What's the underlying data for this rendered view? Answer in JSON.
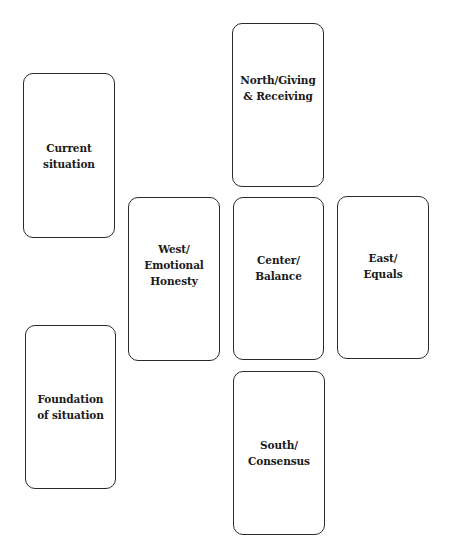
{
  "spread": {
    "cards": [
      {
        "id": "current",
        "label": "Current\nsituation",
        "x": 23,
        "y": 73,
        "w": 92,
        "h": 165,
        "label_offset": 0
      },
      {
        "id": "north",
        "label": "North/Giving\n& Receiving",
        "x": 232,
        "y": 23,
        "w": 92,
        "h": 164,
        "label_offset": -17
      },
      {
        "id": "west",
        "label": "West/\nEmotional\nHonesty",
        "x": 128,
        "y": 197,
        "w": 92,
        "h": 164,
        "label_offset": -14
      },
      {
        "id": "center",
        "label": "Center/\nBalance",
        "x": 233,
        "y": 197,
        "w": 91,
        "h": 163,
        "label_offset": -11
      },
      {
        "id": "east",
        "label": "East/\nEquals",
        "x": 337,
        "y": 196,
        "w": 92,
        "h": 163,
        "label_offset": -12
      },
      {
        "id": "foundation",
        "label": "Foundation\nof situation",
        "x": 25,
        "y": 325,
        "w": 91,
        "h": 164,
        "label_offset": 0
      },
      {
        "id": "south",
        "label": "South/\nConsensus",
        "x": 233,
        "y": 371,
        "w": 92,
        "h": 164,
        "label_offset": 0
      }
    ]
  }
}
